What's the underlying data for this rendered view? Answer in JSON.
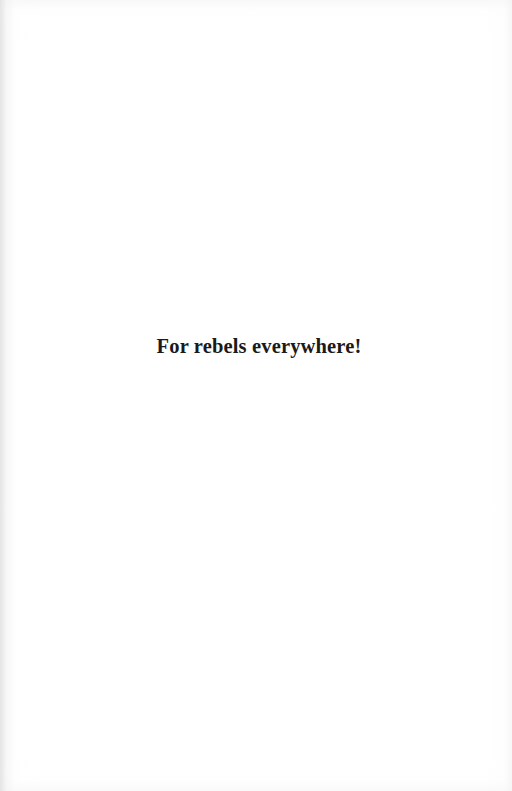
{
  "page": {
    "type": "book-dedication-page",
    "background_color": "#ffffff",
    "text_color": "#1a1a1a"
  },
  "dedication": {
    "text": "For rebels everywhere!"
  }
}
